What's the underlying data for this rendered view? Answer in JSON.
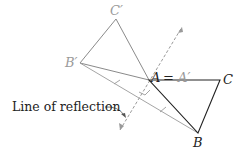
{
  "figure": {
    "colors": {
      "original": "#222222",
      "image": "#9a9a9a",
      "line": "#9a9a9a",
      "background": "#ffffff"
    },
    "points": {
      "A": {
        "label": "A",
        "x": 149,
        "y": 80
      },
      "B": {
        "label": "B",
        "x": 198,
        "y": 133
      },
      "C": {
        "label": "C",
        "x": 220,
        "y": 80
      },
      "A_prime": {
        "label": "A′",
        "x": 149,
        "y": 80
      },
      "B_prime": {
        "label": "B′",
        "x": 80,
        "y": 63
      },
      "C_prime": {
        "label": "C′",
        "x": 116,
        "y": 19
      }
    },
    "labels": {
      "A": "A",
      "equals": "=",
      "A_prime": "A′",
      "B": "B",
      "C": "C",
      "B_prime": "B′",
      "C_prime": "C′",
      "line_of_reflection": "Line of reflection"
    }
  }
}
